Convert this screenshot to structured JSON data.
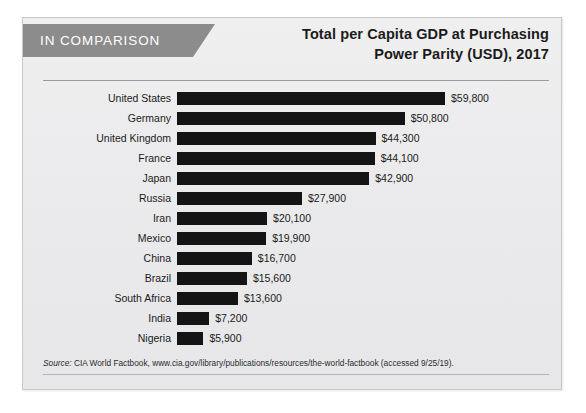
{
  "card": {
    "banner_label": "IN COMPARISON",
    "title_line_1": "Total per Capita GDP at Purchasing",
    "title_line_2": "Power Parity (USD), 2017",
    "source_prefix": "Source:",
    "source_text": " CIA World Factbook, www.cia.gov/library/publications/resources/the-world-factbook (accessed 9/25/19)."
  },
  "colors": {
    "bar": "#141414",
    "banner": "#8c8c8c",
    "card_background": "#ececed",
    "text": "#1b1b1b"
  },
  "chart_data": {
    "type": "bar",
    "orientation": "horizontal",
    "title": "Total per Capita GDP at Purchasing Power Parity (USD), 2017",
    "xlabel": "",
    "ylabel": "",
    "grid": false,
    "legend": "none",
    "xlim": [
      0,
      59800
    ],
    "categories": [
      "United States",
      "Germany",
      "United Kingdom",
      "France",
      "Japan",
      "Russia",
      "Iran",
      "Mexico",
      "China",
      "Brazil",
      "South Africa",
      "India",
      "Nigeria"
    ],
    "values": [
      59800,
      50800,
      44300,
      44100,
      42900,
      27900,
      20100,
      19900,
      16700,
      15600,
      13600,
      7200,
      5900
    ],
    "value_labels": [
      "$59,800",
      "$50,800",
      "$44,300",
      "$44,100",
      "$42,900",
      "$27,900",
      "$20,100",
      "$19,900",
      "$16,700",
      "$15,600",
      "$13,600",
      "$7,200",
      "$5,900"
    ]
  }
}
